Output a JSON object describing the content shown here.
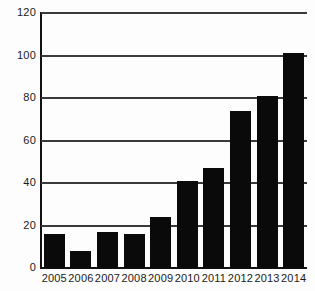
{
  "chart_data": {
    "type": "bar",
    "title": "",
    "subtitle": "",
    "xlabel": "",
    "ylabel": "",
    "categories": [
      "2005",
      "2006",
      "2007",
      "2008",
      "2009",
      "2010",
      "2011",
      "2012",
      "2013",
      "2014"
    ],
    "values": [
      16,
      8,
      17,
      16,
      24,
      41,
      47,
      74,
      81,
      101
    ],
    "series": [
      {
        "name": "",
        "values": [
          16,
          8,
          17,
          16,
          24,
          41,
          47,
          74,
          81,
          101
        ]
      }
    ],
    "ylim": [
      0,
      120
    ],
    "yticks": [
      0,
      20,
      40,
      60,
      80,
      100,
      120
    ],
    "ytick_labels": [
      "0",
      "20",
      "40",
      "60",
      "80",
      "100",
      "120"
    ],
    "xtick_labels": [
      "2005",
      "2006",
      "2007",
      "2008",
      "2009",
      "2010",
      "2011",
      "2012",
      "2013",
      "2014"
    ],
    "grid": true,
    "grid_axis": "y",
    "legend": false,
    "legend_position": "none",
    "annotations": [],
    "colors": {
      "bar": "#0a0a0a",
      "gridline": "#3a3a3a",
      "axis": "#111111",
      "background": "#fdfdfd",
      "text": "#1a1a1a"
    }
  }
}
